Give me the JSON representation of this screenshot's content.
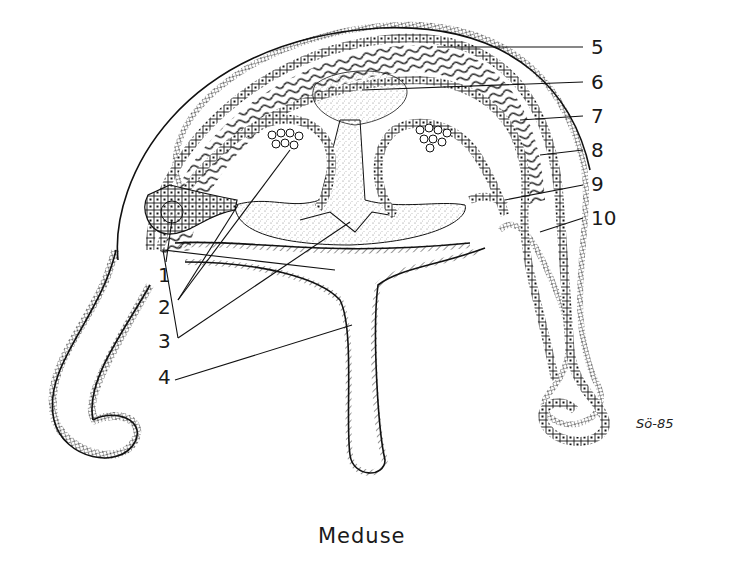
{
  "diagram": {
    "title": "Meduse",
    "signature": "Sö-85",
    "labels": [
      {
        "id": "1",
        "text": "1"
      },
      {
        "id": "2",
        "text": "2"
      },
      {
        "id": "3",
        "text": "3"
      },
      {
        "id": "4",
        "text": "4"
      },
      {
        "id": "5",
        "text": "5"
      },
      {
        "id": "6",
        "text": "6"
      },
      {
        "id": "7",
        "text": "7"
      },
      {
        "id": "8",
        "text": "8"
      },
      {
        "id": "9",
        "text": "9"
      },
      {
        "id": "10",
        "text": "10"
      }
    ],
    "colors": {
      "ink": "#111111",
      "background": "#ffffff",
      "stipple": "#8a8a8a"
    }
  }
}
